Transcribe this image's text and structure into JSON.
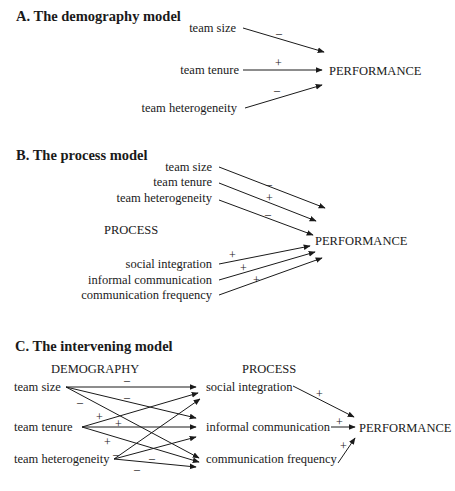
{
  "sections": {
    "A": {
      "title": "A. The demography model",
      "inputs": [
        "team size",
        "team tenure",
        "team heterogeneity"
      ],
      "signs": [
        "–",
        "+",
        "–"
      ],
      "outcome": "PERFORMANCE"
    },
    "B": {
      "title": "B. The process model",
      "demography_inputs": [
        "team size",
        "team tenure",
        "team heterogeneity"
      ],
      "demography_signs": [
        "–",
        "+",
        "–"
      ],
      "process_heading": "PROCESS",
      "process_inputs": [
        "social integration",
        "informal communication",
        "communication frequency"
      ],
      "process_signs": [
        "+",
        "+",
        "+"
      ],
      "outcome": "PERFORMANCE"
    },
    "C": {
      "title": "C. The intervening model",
      "demography_heading": "DEMOGRAPHY",
      "process_heading": "PROCESS",
      "demography": [
        "team size",
        "team tenure",
        "team heterogeneity"
      ],
      "process": [
        "social integration",
        "informal communication",
        "communication frequency"
      ],
      "demography_signs": [
        "–",
        "–",
        "–",
        "+",
        "+",
        "+",
        "–",
        "–",
        "–"
      ],
      "process_signs": [
        "+",
        "+",
        "+"
      ],
      "outcome": "PERFORMANCE"
    }
  },
  "diagram_edges": {
    "A": [
      {
        "from": "team size",
        "to": "PERFORMANCE",
        "sign": "-"
      },
      {
        "from": "team tenure",
        "to": "PERFORMANCE",
        "sign": "+"
      },
      {
        "from": "team heterogeneity",
        "to": "PERFORMANCE",
        "sign": "-"
      }
    ],
    "B": [
      {
        "from": "team size",
        "to": "PERFORMANCE",
        "sign": "-"
      },
      {
        "from": "team tenure",
        "to": "PERFORMANCE",
        "sign": "+"
      },
      {
        "from": "team heterogeneity",
        "to": "PERFORMANCE",
        "sign": "-"
      },
      {
        "from": "social integration",
        "to": "PERFORMANCE",
        "sign": "+"
      },
      {
        "from": "informal communication",
        "to": "PERFORMANCE",
        "sign": "+"
      },
      {
        "from": "communication frequency",
        "to": "PERFORMANCE",
        "sign": "+"
      }
    ],
    "C": [
      {
        "from": "team size",
        "to": "social integration",
        "sign": "-"
      },
      {
        "from": "team size",
        "to": "informal communication",
        "sign": "-"
      },
      {
        "from": "team size",
        "to": "communication frequency",
        "sign": "-"
      },
      {
        "from": "team tenure",
        "to": "social integration",
        "sign": "+"
      },
      {
        "from": "team tenure",
        "to": "informal communication",
        "sign": "+"
      },
      {
        "from": "team tenure",
        "to": "communication frequency",
        "sign": "+"
      },
      {
        "from": "team heterogeneity",
        "to": "social integration",
        "sign": "-"
      },
      {
        "from": "team heterogeneity",
        "to": "informal communication",
        "sign": "-"
      },
      {
        "from": "team heterogeneity",
        "to": "communication frequency",
        "sign": "-"
      },
      {
        "from": "social integration",
        "to": "PERFORMANCE",
        "sign": "+"
      },
      {
        "from": "informal communication",
        "to": "PERFORMANCE",
        "sign": "+"
      },
      {
        "from": "communication frequency",
        "to": "PERFORMANCE",
        "sign": "+"
      }
    ]
  }
}
